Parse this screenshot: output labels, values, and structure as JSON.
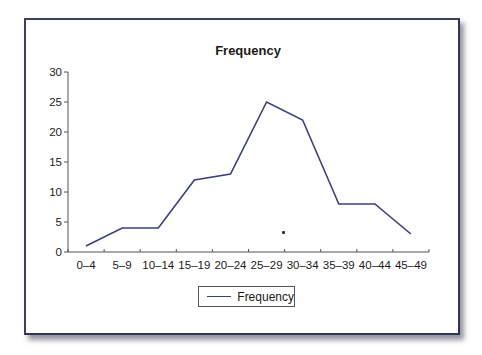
{
  "chart_data": {
    "type": "line",
    "title": "Frequency",
    "xlabel": "",
    "ylabel": "",
    "categories": [
      "0–4",
      "5–9",
      "10–14",
      "15–19",
      "20–24",
      "25–29",
      "30–34",
      "35–39",
      "40–44",
      "45–49"
    ],
    "series": [
      {
        "name": "Frequency",
        "values": [
          1,
          4,
          4,
          12,
          13,
          25,
          22,
          8,
          8,
          3
        ],
        "color": "#3b3f7a"
      }
    ],
    "ylim": [
      0,
      30
    ],
    "yticks": [
      0,
      5,
      10,
      15,
      20,
      25,
      30
    ],
    "grid": false,
    "legend_position": "bottom"
  },
  "legend": {
    "label": "Frequency"
  },
  "colors": {
    "frame_border": "#3a3f63",
    "line": "#3b3f7a"
  }
}
